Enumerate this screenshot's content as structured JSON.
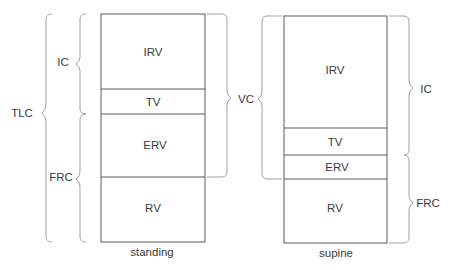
{
  "diagram": {
    "columns": [
      {
        "id": "standing",
        "caption": "standing",
        "segments": [
          {
            "label": "IRV"
          },
          {
            "label": "TV"
          },
          {
            "label": "ERV"
          },
          {
            "label": "RV"
          }
        ],
        "brackets_left": [
          {
            "label": "TLC",
            "spans": "IRV+TV+ERV+RV"
          },
          {
            "label": "IC",
            "spans": "IRV+TV"
          },
          {
            "label": "FRC",
            "spans": "ERV+RV"
          }
        ],
        "brackets_right": [
          {
            "label": "VC",
            "spans": "IRV+TV+ERV"
          }
        ]
      },
      {
        "id": "supine",
        "caption": "supine",
        "segments": [
          {
            "label": "IRV"
          },
          {
            "label": "TV"
          },
          {
            "label": "ERV"
          },
          {
            "label": "RV"
          }
        ],
        "brackets_left": [],
        "brackets_right": [
          {
            "label": "IC",
            "spans": "IRV+TV"
          },
          {
            "label": "FRC",
            "spans": "ERV+RV"
          }
        ]
      }
    ],
    "colors": {
      "line": "#555555",
      "bracket": "#9a9a9a",
      "text": "#3b3b3b"
    }
  }
}
